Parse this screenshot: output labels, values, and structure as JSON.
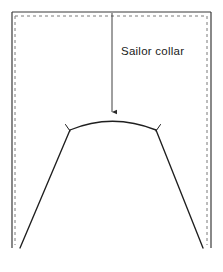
{
  "figure": {
    "kind": "sewing-pattern-diagram",
    "width": 223,
    "height": 272,
    "background_color": "#ffffff"
  },
  "annotations": [
    {
      "id": "sailor-collar",
      "text": "Sailor collar",
      "color": "#1a1a1a",
      "x": 121,
      "y": 44
    }
  ],
  "leader_arrow": {
    "name": "leader-arrow",
    "from_x": 112,
    "from_y": 13,
    "to_x": 112,
    "to_y": 117,
    "color": "#2b2b2b",
    "stroke_width": 0.9,
    "arrowhead": "solid-triangle-down"
  },
  "outline_solid": {
    "name": "fabric-outline",
    "color": "#3a3a3a",
    "stroke_width": 1.2,
    "points": "12,12 211,12 211,248 12,248"
  },
  "outline_dashed": {
    "name": "seam-allowance-guide",
    "color": "#7a7a7a",
    "stroke_width": 1.0,
    "dash_pattern": "3 3",
    "points": "15,16 207,16 207,245 15,245"
  },
  "collar_curve": {
    "name": "collar-neckline-curve",
    "color": "#1f1f1f",
    "stroke_width": 1.3,
    "apex_x": 112,
    "apex_y": 118,
    "left_end_x": 70,
    "left_end_y": 130,
    "right_end_x": 156,
    "right_end_y": 130,
    "path": "M 70,130 Q 112,113 156,130"
  },
  "side_seams": [
    {
      "name": "left-side-seam",
      "color": "#1f1f1f",
      "stroke_width": 1.3,
      "from_x": 70,
      "from_y": 130,
      "to_x": 20,
      "to_y": 248
    },
    {
      "name": "right-side-seam",
      "color": "#1f1f1f",
      "stroke_width": 1.3,
      "from_x": 156,
      "from_y": 130,
      "to_x": 203,
      "to_y": 248
    }
  ],
  "notch_marks": [
    {
      "name": "notch-left",
      "color": "#1f1f1f",
      "stroke_width": 1.0,
      "x": 70,
      "y": 130,
      "tick_x": 66,
      "tick_y": 124
    },
    {
      "name": "notch-right",
      "color": "#1f1f1f",
      "stroke_width": 1.0,
      "x": 156,
      "y": 130,
      "tick_x": 161,
      "tick_y": 124
    }
  ]
}
